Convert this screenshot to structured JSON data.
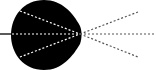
{
  "diagram": {
    "title": "",
    "colors": {
      "background": "#ffffff",
      "body": "#000000",
      "incoming_ray": "#000000",
      "inner_rays": "#ffffff",
      "outer_rays": "#555555"
    },
    "elements": {
      "incoming_ray": {
        "x1": 0,
        "y1": 34,
        "x2": 12,
        "y2": 34,
        "style": "solid"
      },
      "body": {
        "shape": "rounded-lens",
        "cx": 44,
        "cy": 35,
        "width": 68,
        "height": 70
      },
      "focal_point": {
        "x": 80,
        "y": 34
      },
      "inner_rays": [
        {
          "x1": 20,
          "y1": 11,
          "x2": 80,
          "y2": 34
        },
        {
          "x1": 12,
          "y1": 34,
          "x2": 80,
          "y2": 34
        },
        {
          "x1": 20,
          "y1": 57,
          "x2": 80,
          "y2": 34
        }
      ],
      "outer_rays": [
        {
          "x1": 80,
          "y1": 34,
          "x2": 138,
          "y2": 12
        },
        {
          "x1": 80,
          "y1": 34,
          "x2": 156,
          "y2": 34
        },
        {
          "x1": 80,
          "y1": 34,
          "x2": 138,
          "y2": 57
        }
      ]
    }
  }
}
